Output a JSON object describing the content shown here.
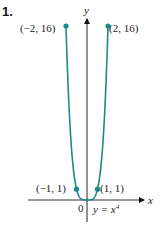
{
  "problem_number": "1.",
  "chart_data": {
    "type": "line",
    "title": "",
    "equation_label": "y = x^4",
    "xlabel": "x",
    "ylabel": "y",
    "origin_label": "0",
    "function": "y = x^4",
    "xlim": [
      -2.1,
      2.1
    ],
    "ylim": [
      -1,
      16.5
    ],
    "grid": false,
    "legend": null,
    "series": [
      {
        "name": "y = x^4",
        "color": "#1a8a8a",
        "x": [
          -2,
          -1.75,
          -1.5,
          -1.25,
          -1,
          -0.75,
          -0.5,
          -0.25,
          0,
          0.25,
          0.5,
          0.75,
          1,
          1.25,
          1.5,
          1.75,
          2
        ],
        "y": [
          16,
          9.38,
          5.06,
          2.44,
          1,
          0.32,
          0.06,
          0.004,
          0,
          0.004,
          0.06,
          0.32,
          1,
          2.44,
          5.06,
          9.38,
          16
        ]
      }
    ],
    "annotations": [
      {
        "label": "(−2, 16)",
        "x": -2,
        "y": 16
      },
      {
        "label": "(2, 16)",
        "x": 2,
        "y": 16
      },
      {
        "label": "(−1, 1)",
        "x": -1,
        "y": 1
      },
      {
        "label": "(1, 1)",
        "x": 1,
        "y": 1
      }
    ]
  }
}
